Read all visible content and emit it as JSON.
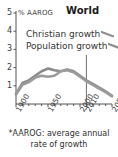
{
  "chart_data": {
    "type": "line",
    "title": "World",
    "ylabel": "% AAROG",
    "xlabel": "",
    "ylim": [
      0,
      5
    ],
    "xlim": [
      1900,
      2050
    ],
    "yticks": [
      "1",
      "2",
      "3",
      "4",
      "5"
    ],
    "ytick_values": [
      1,
      2,
      3,
      4,
      5
    ],
    "xticks": [
      "1900",
      "1950",
      "2000",
      "2010",
      "2050"
    ],
    "xtick_values": [
      1900,
      1950,
      2000,
      2010,
      2050
    ],
    "grid": false,
    "legend_position": "upper-center",
    "annotations": [
      {
        "name": "projection-divider",
        "x": 2010,
        "label": ""
      }
    ],
    "series": [
      {
        "name": "Christian growth",
        "color": "#8a8a8a",
        "x": [
          1900,
          1910,
          1920,
          1930,
          1940,
          1950,
          1960,
          1970,
          1980,
          1990,
          2000,
          2010,
          2020,
          2030,
          2040,
          2050
        ],
        "values": [
          0.55,
          1.15,
          1.3,
          1.55,
          1.8,
          1.95,
          1.85,
          1.8,
          1.9,
          1.8,
          1.55,
          1.3,
          1.1,
          0.9,
          0.7,
          0.45
        ]
      },
      {
        "name": "Population growth",
        "color": "#9b9b9b",
        "x": [
          1900,
          1910,
          1920,
          1930,
          1940,
          1950,
          1960,
          1970,
          1980,
          1990,
          2000,
          2010,
          2020,
          2030,
          2040,
          2050
        ],
        "values": [
          0.52,
          1.05,
          1.2,
          1.45,
          1.55,
          1.5,
          1.55,
          1.8,
          1.85,
          1.75,
          1.5,
          1.25,
          1.05,
          0.85,
          0.65,
          0.42
        ]
      }
    ]
  },
  "legend": {
    "items": [
      {
        "label": "Christian growth",
        "icon": "line-swatch-icon"
      },
      {
        "label": "Population growth",
        "icon": "line-swatch-icon"
      }
    ]
  },
  "footnote": {
    "line1": "*AAROG: average annual",
    "line2": "rate of growth"
  },
  "colors": {
    "series": "#8d8d8d",
    "axis": "#555555",
    "text": "#333333",
    "divider": "#6e6e6e"
  }
}
